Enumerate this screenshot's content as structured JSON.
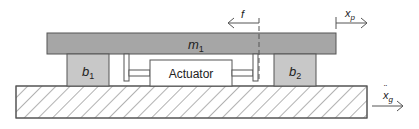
{
  "diagram": {
    "mass": {
      "label": "m",
      "sub": "1"
    },
    "damper_left": {
      "label": "b",
      "sub": "1"
    },
    "damper_right": {
      "label": "b",
      "sub": "2"
    },
    "actuator": {
      "label": "Actuator"
    },
    "force": {
      "label": "f"
    },
    "displacement": {
      "label": "x",
      "sub": "p"
    },
    "ground_accel": {
      "label": "x",
      "dots": "¨",
      "sub": "g"
    },
    "colors": {
      "plate": "#a6a6a6",
      "damper": "#c8c8c8",
      "outline": "#555555",
      "hatch": "#666666",
      "background": "#ffffff"
    }
  }
}
